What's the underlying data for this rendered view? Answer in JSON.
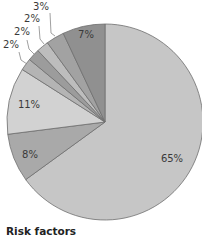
{
  "chart_data": {
    "type": "pie",
    "title": "",
    "legend_title": "Risk factors",
    "start_angle_deg": 0,
    "direction": "clockwise",
    "slices": [
      {
        "label": "65%",
        "value": 65,
        "color": "#c6c6c6"
      },
      {
        "label": "8%",
        "value": 8,
        "color": "#a9a9a9"
      },
      {
        "label": "11%",
        "value": 11,
        "color": "#d2d2d2"
      },
      {
        "label": "2%",
        "value": 2,
        "color": "#b4b4b4"
      },
      {
        "label": "2%",
        "value": 2,
        "color": "#9c9c9c"
      },
      {
        "label": "2%",
        "value": 2,
        "color": "#bdbdbd"
      },
      {
        "label": "3%",
        "value": 3,
        "color": "#a2a2a2"
      },
      {
        "label": "7%",
        "value": 7,
        "color": "#909090"
      }
    ],
    "values": [
      65,
      8,
      11,
      2,
      2,
      2,
      3,
      7
    ],
    "categories": [
      "65%",
      "8%",
      "11%",
      "2%",
      "2%",
      "2%",
      "3%",
      "7%"
    ]
  },
  "legend": {
    "title": "Risk factors"
  }
}
